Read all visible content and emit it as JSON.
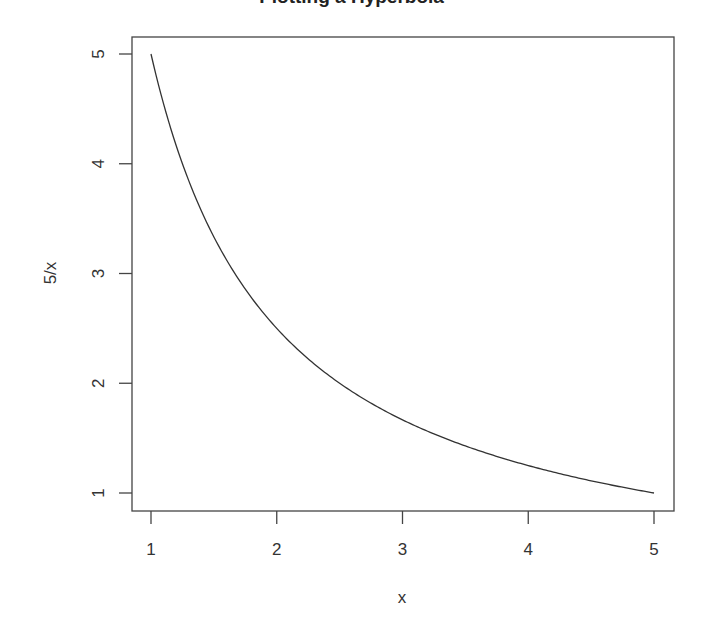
{
  "chart_data": {
    "type": "line",
    "title": "Plotting a Hyperbola",
    "xlabel": "x",
    "ylabel": "5/x",
    "xlim": [
      1,
      5
    ],
    "ylim": [
      1,
      5
    ],
    "xticks": [
      "1",
      "2",
      "3",
      "4",
      "5"
    ],
    "yticks": [
      "1",
      "2",
      "3",
      "4",
      "5"
    ],
    "grid": false,
    "legend": null,
    "series": [
      {
        "name": "5/x",
        "function": "5/x",
        "x": [
          1,
          1.25,
          1.5,
          1.75,
          2,
          2.5,
          3,
          3.5,
          4,
          4.5,
          5
        ],
        "y": [
          5,
          4,
          3.333,
          2.857,
          2.5,
          2,
          1.667,
          1.429,
          1.25,
          1.111,
          1
        ],
        "color": "#333333"
      }
    ]
  }
}
